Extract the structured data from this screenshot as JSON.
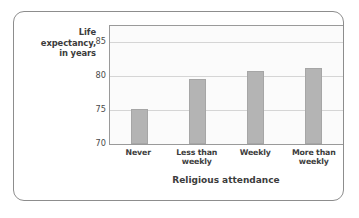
{
  "chart_data": {
    "type": "bar",
    "title": "",
    "categories": [
      "Never",
      "Less than weekly",
      "Weekly",
      "More than weekly"
    ],
    "values": [
      75.2,
      79.6,
      80.8,
      81.2
    ],
    "xlabel": "Religious attendance",
    "ylabel": "Life expectancy, in years",
    "ylim": [
      70,
      87.4
    ],
    "yticks": [
      70,
      75,
      80,
      85
    ],
    "ytick_labels": [
      "70",
      "75",
      "80",
      "85"
    ],
    "grid": true,
    "legend": "none",
    "series": [
      {
        "name": "Life expectancy",
        "values": [
          75.2,
          79.6,
          80.8,
          81.2
        ]
      }
    ],
    "colors": {
      "bar_fill": "#b4b4b4",
      "bar_stroke": "#a6a6a6",
      "gridline": "#d5d5d5",
      "axis": "#9a9a9a",
      "plot_background": "#fbfbfb",
      "frame_border": "#8d8d8d",
      "text": "#3c3c3c"
    }
  },
  "axis_titles": {
    "y_line1": "Life",
    "y_line2": "expectancy,",
    "y_line3": "in years",
    "x": "Religious attendance"
  },
  "x_tick_labels": [
    {
      "line1": "Never",
      "line2": ""
    },
    {
      "line1": "Less than",
      "line2": "weekly"
    },
    {
      "line1": "Weekly",
      "line2": ""
    },
    {
      "line1": "More than",
      "line2": "weekly"
    }
  ]
}
